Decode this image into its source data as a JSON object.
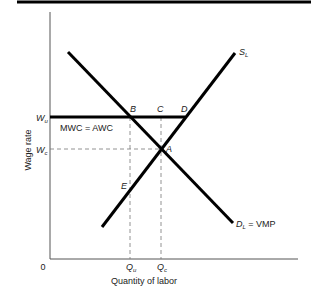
{
  "diagram": {
    "type": "labor-market-union-wage",
    "axes": {
      "ylabel": "Wage rate",
      "xlabel": "Quantity of labor",
      "origin": "0"
    },
    "y_ticks": [
      {
        "main": "W",
        "sub": "u"
      },
      {
        "main": "W",
        "sub": "c"
      }
    ],
    "x_ticks": [
      {
        "main": "Q",
        "sub": "u"
      },
      {
        "main": "Q",
        "sub": "c"
      }
    ],
    "curves": {
      "supply": {
        "main": "S",
        "sub": "L"
      },
      "demand": {
        "main": "D",
        "sub": "L",
        "suffix": " = VMP"
      },
      "mwc": "MWC = AWC"
    },
    "points": {
      "A": "A",
      "B": "B",
      "C": "C",
      "D": "D",
      "E": "E"
    },
    "colors": {
      "line": "#000000",
      "axis": "#555555",
      "guide": "#777777",
      "text": "#222222"
    }
  }
}
